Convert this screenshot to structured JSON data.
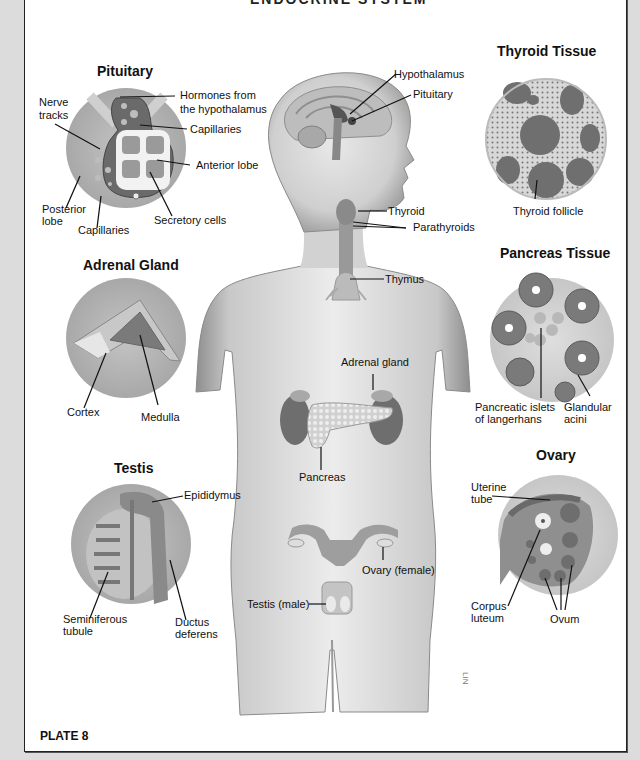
{
  "title_partial": "ENDOCRINE SYSTEM",
  "plate": "PLATE 8",
  "artist_signature": "LIN",
  "main_figure": {
    "labels": {
      "hypothalamus": "Hypothalamus",
      "pituitary": "Pituitary",
      "thyroid": "Thyroid",
      "parathyroids": "Parathyroids",
      "thymus": "Thymus",
      "adrenal_gland": "Adrenal gland",
      "pancreas": "Pancreas",
      "ovary": "Ovary (female)",
      "testis": "Testis (male)"
    }
  },
  "insets": {
    "pituitary": {
      "title": "Pituitary",
      "labels": {
        "hormones_line1": "Hormones from",
        "hormones_line2": "the hypothalamus",
        "nerve_line1": "Nerve",
        "nerve_line2": "tracks",
        "capillaries_top": "Capillaries",
        "anterior_lobe": "Anterior lobe",
        "posterior_line1": "Posterior",
        "posterior_line2": "lobe",
        "capillaries_bottom": "Capillaries",
        "secretory_cells": "Secretory cells"
      }
    },
    "adrenal": {
      "title": "Adrenal Gland",
      "labels": {
        "cortex": "Cortex",
        "medulla": "Medulla"
      }
    },
    "testis": {
      "title": "Testis",
      "labels": {
        "epididymus": "Epididymus",
        "seminiferous_line1": "Seminiferous",
        "seminiferous_line2": "tubule",
        "ductus_line1": "Ductus",
        "ductus_line2": "deferens"
      }
    },
    "thyroid_tissue": {
      "title": "Thyroid Tissue",
      "labels": {
        "follicle": "Thyroid follicle"
      }
    },
    "pancreas_tissue": {
      "title": "Pancreas Tissue",
      "labels": {
        "islets_line1": "Pancreatic islets",
        "islets_line2": "of langerhans",
        "acini_line1": "Glandular",
        "acini_line2": "acini"
      }
    },
    "ovary": {
      "title": "Ovary",
      "labels": {
        "uterine_line1": "Uterine",
        "uterine_line2": "tube",
        "corpus_line1": "Corpus",
        "corpus_line2": "luteum",
        "ovum": "Ovum"
      }
    }
  },
  "colors": {
    "page": "#ffffff",
    "background": "#dcdcdc",
    "skin": "#d4d4d4",
    "skin_shadow": "#9a9a9a",
    "organ_dark": "#6e6e6e",
    "inset_disc": "#b4b4b4"
  }
}
